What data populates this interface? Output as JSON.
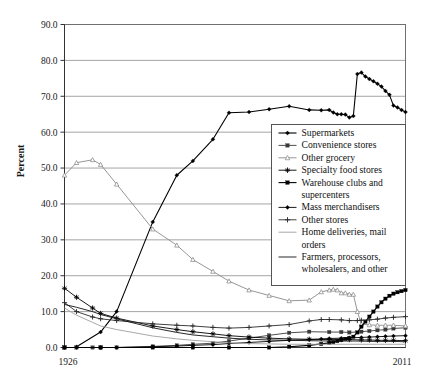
{
  "chart_data": {
    "type": "line",
    "title": "",
    "xlabel": "",
    "ylabel": "Percent",
    "ylim": [
      0.0,
      90.0
    ],
    "xlim": [
      1926,
      2011
    ],
    "ytick_labels": [
      "0.0",
      "10.0",
      "20.0",
      "30.0",
      "40.0",
      "50.0",
      "60.0",
      "70.0",
      "80.0",
      "90.0"
    ],
    "ytick_values": [
      0.0,
      10.0,
      20.0,
      30.0,
      40.0,
      50.0,
      60.0,
      70.0,
      80.0,
      90.0
    ],
    "xtick_labels": [
      "1926",
      "2011"
    ],
    "xtick_values": [
      1926,
      2011
    ],
    "grid": "horizontal",
    "legend_position": "center-right",
    "series": [
      {
        "name": "Supermarkets",
        "marker": "diamond-filled",
        "color": "#000000",
        "width": 1.1,
        "x": [
          1929,
          1935,
          1939,
          1948,
          1954,
          1958,
          1963,
          1967,
          1972,
          1977,
          1982,
          1987,
          1990,
          1992,
          1993,
          1994,
          1995,
          1996,
          1997,
          1998,
          1999,
          2000,
          2001,
          2002,
          2003,
          2004,
          2005,
          2006,
          2007,
          2008,
          2009,
          2010,
          2011
        ],
        "y": [
          0.2,
          4.3,
          10.0,
          35.0,
          48.0,
          52.0,
          58.0,
          65.4,
          65.6,
          66.4,
          67.2,
          66.2,
          66.1,
          66.2,
          65.5,
          65.0,
          65.0,
          64.9,
          64.1,
          64.5,
          76.2,
          76.6,
          75.5,
          74.8,
          74.2,
          73.5,
          72.7,
          71.5,
          70.4,
          67.4,
          66.9,
          66.2,
          65.6
        ]
      },
      {
        "name": "Convenience stores",
        "marker": "square-filled",
        "color": "#3a3a3a",
        "width": 0.9,
        "x": [
          1926,
          1929,
          1933,
          1935,
          1939,
          1948,
          1954,
          1958,
          1963,
          1967,
          1972,
          1977,
          1982,
          1987,
          1992,
          1995,
          1997,
          2000,
          2002,
          2004,
          2006,
          2008,
          2011
        ],
        "y": [
          0.0,
          0.0,
          0.0,
          0.0,
          0.0,
          0.3,
          0.6,
          0.9,
          1.2,
          1.8,
          2.6,
          3.4,
          4.1,
          4.4,
          4.3,
          4.3,
          4.2,
          4.4,
          4.6,
          4.8,
          5.0,
          5.3,
          5.5
        ]
      },
      {
        "name": "Other grocery",
        "marker": "triangle-open",
        "color": "#8a8a8a",
        "width": 0.9,
        "x": [
          1926,
          1929,
          1933,
          1935,
          1939,
          1948,
          1954,
          1958,
          1963,
          1967,
          1972,
          1977,
          1982,
          1987,
          1990,
          1992,
          1993,
          1994,
          1995,
          1996,
          1997,
          1998,
          1999,
          2000,
          2002,
          2004,
          2006,
          2008,
          2011
        ],
        "y": [
          48.0,
          51.5,
          52.3,
          51.0,
          45.5,
          33.0,
          28.5,
          24.5,
          21.2,
          18.5,
          16.0,
          14.5,
          13.0,
          13.2,
          15.5,
          16.0,
          16.2,
          16.0,
          15.2,
          15.2,
          14.8,
          14.8,
          10.0,
          6.5,
          6.3,
          6.2,
          6.2,
          6.2,
          6.0
        ]
      },
      {
        "name": "Specialty food stores",
        "marker": "star-filled",
        "color": "#000000",
        "width": 0.9,
        "x": [
          1926,
          1929,
          1933,
          1935,
          1939,
          1948,
          1954,
          1958,
          1963,
          1967,
          1972,
          1977,
          1982,
          1987,
          1992,
          1995,
          1997,
          2000,
          2002,
          2004,
          2006,
          2008,
          2011
        ],
        "y": [
          16.5,
          14.0,
          11.0,
          9.5,
          8.2,
          6.0,
          5.0,
          4.4,
          3.8,
          3.3,
          2.9,
          2.6,
          2.4,
          2.3,
          2.2,
          2.2,
          2.2,
          2.1,
          2.1,
          2.0,
          2.0,
          2.0,
          1.9
        ]
      },
      {
        "name": "Warehouse clubs and supercenters",
        "marker": "square-filled",
        "color": "#000000",
        "width": 1.1,
        "x": [
          1926,
          1935,
          1948,
          1958,
          1967,
          1977,
          1982,
          1987,
          1990,
          1992,
          1993,
          1994,
          1995,
          1996,
          1997,
          1998,
          1999,
          2000,
          2001,
          2002,
          2003,
          2004,
          2005,
          2006,
          2007,
          2008,
          2009,
          2010,
          2011
        ],
        "y": [
          0.0,
          0.0,
          0.0,
          0.0,
          0.0,
          0.0,
          0.2,
          0.6,
          1.0,
          1.3,
          1.5,
          1.8,
          2.1,
          2.4,
          2.6,
          3.0,
          4.2,
          5.8,
          7.2,
          8.6,
          10.0,
          11.4,
          12.6,
          13.6,
          14.4,
          15.0,
          15.4,
          15.7,
          16.0
        ]
      },
      {
        "name": "Mass merchandisers",
        "marker": "diamond-filled",
        "color": "#000000",
        "width": 0.9,
        "x": [
          1926,
          1929,
          1935,
          1939,
          1948,
          1954,
          1958,
          1963,
          1967,
          1972,
          1977,
          1982,
          1987,
          1990,
          1992,
          1995,
          1997,
          2000,
          2002,
          2004,
          2006,
          2008,
          2011
        ],
        "y": [
          0.0,
          0.0,
          0.0,
          0.0,
          0.2,
          0.4,
          0.6,
          0.8,
          1.1,
          1.4,
          1.7,
          2.0,
          2.2,
          2.4,
          2.5,
          2.6,
          2.7,
          2.8,
          2.9,
          3.0,
          3.1,
          3.2,
          3.3
        ]
      },
      {
        "name": "Other stores",
        "marker": "plus",
        "color": "#2b2b2b",
        "width": 0.9,
        "x": [
          1926,
          1929,
          1933,
          1935,
          1939,
          1948,
          1954,
          1958,
          1963,
          1967,
          1972,
          1977,
          1982,
          1987,
          1990,
          1992,
          1995,
          1997,
          1999,
          2000,
          2002,
          2004,
          2006,
          2008,
          2011
        ],
        "y": [
          12.5,
          10.0,
          8.5,
          8.0,
          7.5,
          6.6,
          6.2,
          6.0,
          5.6,
          5.4,
          5.6,
          6.0,
          6.4,
          7.4,
          7.8,
          7.8,
          7.7,
          7.5,
          7.5,
          7.6,
          7.7,
          7.9,
          8.2,
          8.4,
          8.6
        ]
      },
      {
        "name": "Home deliveries, mail orders",
        "marker": "none",
        "color": "#9e9e9e",
        "width": 0.9,
        "x": [
          1926,
          1929,
          1933,
          1935,
          1939,
          1948,
          1954,
          1958,
          1963,
          1967,
          1972,
          1977,
          1982,
          1987,
          1992,
          1995,
          1997,
          2000,
          2002,
          2004,
          2006,
          2008,
          2011
        ],
        "y": [
          11.0,
          9.0,
          7.0,
          6.0,
          5.0,
          3.2,
          2.4,
          2.0,
          1.6,
          1.3,
          1.1,
          1.0,
          0.9,
          0.9,
          0.9,
          0.9,
          0.9,
          0.9,
          0.9,
          0.9,
          0.9,
          0.9,
          0.9
        ]
      },
      {
        "name": "Farmers, processors, wholesalers, and other",
        "marker": "none",
        "color": "#111111",
        "width": 0.9,
        "x": [
          1926,
          1929,
          1933,
          1935,
          1939,
          1948,
          1954,
          1958,
          1963,
          1967,
          1972,
          1977,
          1982,
          1987,
          1992,
          1995,
          1997,
          2000,
          2002,
          2004,
          2006,
          2008,
          2011
        ],
        "y": [
          12.0,
          11.2,
          10.0,
          9.2,
          8.0,
          5.5,
          4.2,
          3.5,
          3.0,
          2.6,
          2.3,
          2.1,
          2.0,
          1.9,
          1.8,
          1.8,
          1.8,
          1.8,
          1.7,
          1.7,
          1.7,
          1.7,
          1.6
        ]
      }
    ]
  },
  "legend": {
    "entries": [
      {
        "label": "Supermarkets"
      },
      {
        "label": "Convenience stores"
      },
      {
        "label": "Other grocery"
      },
      {
        "label": "Specialty food stores"
      },
      {
        "label": "Warehouse clubs and"
      },
      {
        "label": "supercenters"
      },
      {
        "label": "Mass merchandisers"
      },
      {
        "label": "Other stores"
      },
      {
        "label": "Home deliveries, mail"
      },
      {
        "label": "orders"
      },
      {
        "label": "Farmers, processors,"
      },
      {
        "label": "wholesalers, and other"
      }
    ]
  }
}
